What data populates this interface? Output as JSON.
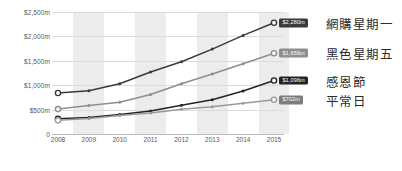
{
  "chart_data": {
    "type": "line",
    "title": "",
    "xlabel": "",
    "ylabel": "",
    "x": [
      2008,
      2009,
      2010,
      2011,
      2012,
      2013,
      2014,
      2015
    ],
    "categories": [
      "2008",
      "2009",
      "2010",
      "2011",
      "2012",
      "2013",
      "2014",
      "2015"
    ],
    "ylim": [
      0,
      2500
    ],
    "ytick_values": [
      0,
      500,
      1000,
      1500,
      2000,
      2500
    ],
    "ytick_labels": [
      "0",
      "$500m",
      "$1,000m",
      "$1,500m",
      "$2,000m",
      "$2,500m"
    ],
    "grid": true,
    "legend_position": "right",
    "banded_columns": [
      "2009",
      "2011",
      "2013",
      "2015"
    ],
    "series": [
      {
        "name": "網購星期一",
        "values": [
          840,
          885,
          1030,
          1270,
          1480,
          1740,
          2020,
          2280
        ],
        "end_label": "$2,280m",
        "color": "#3a3a3c",
        "badge_color": "#3a3a3c"
      },
      {
        "name": "黑色星期五",
        "values": [
          510,
          585,
          650,
          810,
          1030,
          1230,
          1440,
          1656
        ],
        "end_label": "$1,656m",
        "color": "#8e8e90",
        "badge_color": "#8e8e90"
      },
      {
        "name": "感恩節",
        "values": [
          310,
          340,
          400,
          470,
          590,
          700,
          880,
          1096
        ],
        "end_label": "$1,096m",
        "color": "#232325",
        "badge_color": "#232325"
      },
      {
        "name": "平常日",
        "values": [
          280,
          320,
          380,
          430,
          505,
          560,
          630,
          702
        ],
        "end_label": "$702m",
        "color": "#9a9a9c",
        "badge_color": "#7d7d80"
      }
    ]
  },
  "axis": {
    "y_labels": [
      "$2,500m",
      "$2,000m",
      "$1,500m",
      "$1,000m",
      "$500m",
      "0"
    ],
    "x_labels": [
      "2008",
      "2009",
      "2010",
      "2011",
      "2012",
      "2013",
      "2014",
      "2015"
    ]
  },
  "legend": {
    "items": [
      {
        "label": "網購星期一",
        "value": "$2,280m"
      },
      {
        "label": "黑色星期五",
        "value": "$1,656m"
      },
      {
        "label": "感恩節",
        "value": "$1,096m"
      },
      {
        "label": "平常日",
        "value": "$702m"
      }
    ]
  },
  "colors": {
    "band": "#ececec",
    "gridline": "#dcdcdc",
    "axis_text": "#58585a",
    "legend_text": "#2b2b2b",
    "background": "#ffffff"
  }
}
